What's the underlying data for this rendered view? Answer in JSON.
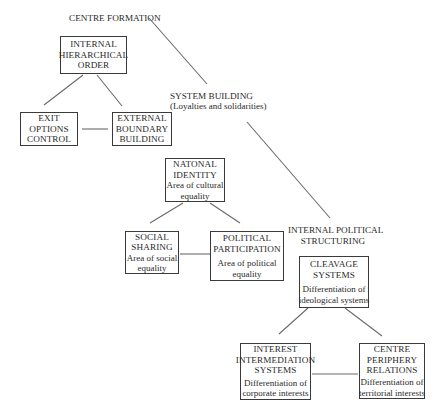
{
  "diagram": {
    "headings": {
      "centre_formation": "CENTRE FORMATION",
      "system_building": "SYSTEM BUILDING",
      "system_building_sub": "(Loyalties and solidarities)",
      "internal_political_1": "INTERNAL POLITICAL",
      "internal_political_2": "STRUCTURING"
    },
    "boxes": {
      "internal_hierarchical": {
        "lines": [
          "INTERNAL",
          "HIERARCHICAL",
          "ORDER"
        ]
      },
      "exit_options": {
        "lines": [
          "EXIT",
          "OPTIONS",
          "CONTROL"
        ]
      },
      "external_boundary": {
        "lines": [
          "EXTERNAL",
          "BOUNDARY",
          "BUILDING"
        ]
      },
      "national_identity": {
        "lines": [
          "NATONAL",
          "IDENTITY"
        ],
        "sub": [
          "Area of cultural",
          "equality"
        ]
      },
      "social_sharing": {
        "lines": [
          "SOCIAL",
          "SHARING"
        ],
        "sub": [
          "Area of social",
          "equality"
        ]
      },
      "political_participation": {
        "lines": [
          "POLITICAL",
          "PARTICIPATION"
        ],
        "sub": [
          "Area of political",
          "equality"
        ]
      },
      "cleavage_systems": {
        "lines": [
          "CLEAVAGE",
          "SYSTEMS"
        ],
        "sub": [
          "Differentiation of",
          "ideological systems"
        ]
      },
      "interest_intermediation": {
        "lines": [
          "INTEREST",
          "INTERMEDIATION",
          "SYSTEMS"
        ],
        "sub": [
          "Differentiation of",
          "corporate interests"
        ]
      },
      "centre_periphery": {
        "lines": [
          "CENTRE",
          "PERIPHERY",
          "RELATIONS"
        ],
        "sub": [
          "Differentiation of",
          "territorial interests"
        ]
      }
    },
    "colors": {
      "line": "#6a6a6a",
      "border": "#3a3a3a",
      "text": "#2a2a2a"
    }
  }
}
